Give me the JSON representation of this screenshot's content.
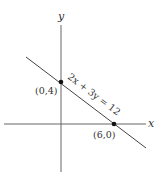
{
  "diagram": {
    "type": "coordinate-graph",
    "axes": {
      "x_label": "x",
      "y_label": "y"
    },
    "line": {
      "equation": "2x + 3y = 12"
    },
    "points": [
      {
        "label": "(0,4)",
        "x": 0,
        "y": 4
      },
      {
        "label": "(6,0)",
        "x": 6,
        "y": 0
      }
    ],
    "colors": {
      "axis": "#555555",
      "line": "#444444",
      "point": "#111111",
      "text": "#333333"
    }
  }
}
